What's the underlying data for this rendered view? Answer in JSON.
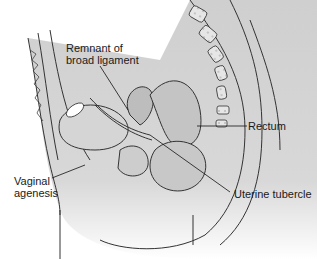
{
  "figure": {
    "labels": [
      {
        "id": "broad_ligament",
        "text": "Remnant of\nbroad ligament"
      },
      {
        "id": "rectum",
        "text": "Rectum"
      },
      {
        "id": "vaginal_agenesis",
        "text": "Vaginal\nagenesis"
      },
      {
        "id": "uterine_tubercle",
        "text": "Uterine tubercle"
      }
    ]
  }
}
